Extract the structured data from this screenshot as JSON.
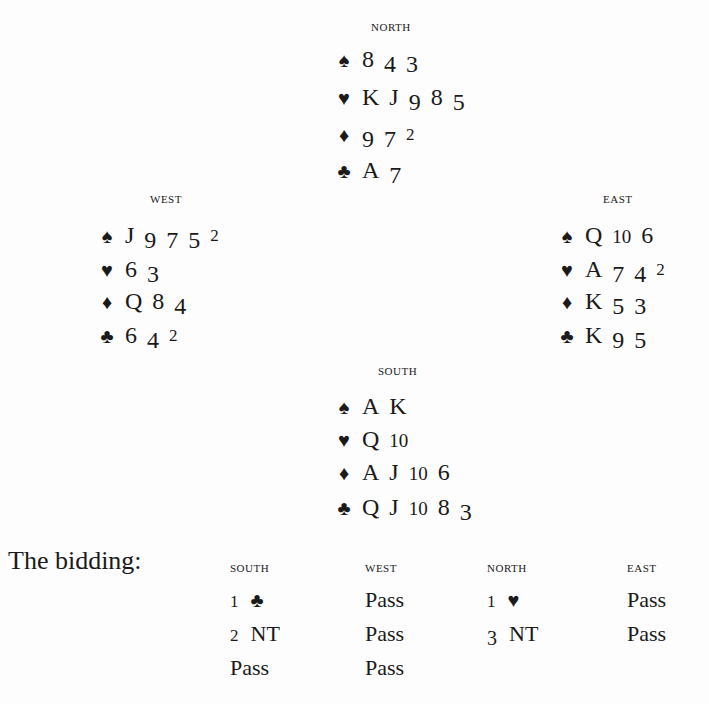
{
  "hands": {
    "north": {
      "label": "NORTH",
      "spades": "8 4 3",
      "hearts": "K J 9 8 5",
      "diamonds": "9 7 2",
      "clubs": "A 7"
    },
    "west": {
      "label": "WEST",
      "spades": "J 9 7 5 2",
      "hearts": "6 3",
      "diamonds": "Q 8 4",
      "clubs": "6 4 2"
    },
    "east": {
      "label": "EAST",
      "spades": "Q 10 6",
      "hearts": "A 7 4 2",
      "diamonds": "K 5 3",
      "clubs": "K 9 5"
    },
    "south": {
      "label": "SOUTH",
      "spades": "A K",
      "hearts": "Q 10",
      "diamonds": "A J 10 6",
      "clubs": "Q J 10 8 3"
    }
  },
  "icons": {
    "spade": "♠",
    "heart": "♥",
    "diamond": "♦",
    "club": "♣"
  },
  "bidding": {
    "title": "The bidding:",
    "columns": [
      "SOUTH",
      "WEST",
      "NORTH",
      "EAST"
    ],
    "rounds": [
      [
        "1 ♣",
        "Pass",
        "1 ♥",
        "Pass"
      ],
      [
        "2 NT",
        "Pass",
        "3 NT",
        "Pass"
      ],
      [
        "Pass",
        "Pass",
        "",
        ""
      ]
    ],
    "south": {
      "head": "SOUTH",
      "r1_level": "1",
      "r1_suit": "♣",
      "r2_level": "2",
      "r2_suit": "NT",
      "r3": "Pass"
    },
    "west": {
      "head": "WEST",
      "r1": "Pass",
      "r2": "Pass",
      "r3": "Pass"
    },
    "north": {
      "head": "NORTH",
      "r1_level": "1",
      "r1_suit": "♥",
      "r2_level": "3",
      "r2_suit": "NT"
    },
    "east": {
      "head": "EAST",
      "r1": "Pass",
      "r2": "Pass"
    }
  }
}
